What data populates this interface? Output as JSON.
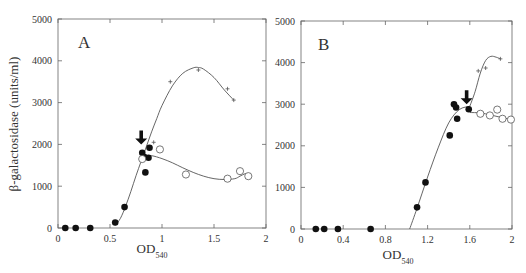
{
  "figure": {
    "ylabel": "β-galactosidase (units/ml)",
    "xlabel_main": "OD",
    "xlabel_sub": "540"
  },
  "chart_data": [
    {
      "type": "scatter",
      "panel": "A",
      "xlabel": "OD540",
      "ylabel": "β-galactosidase (units/ml)",
      "xlim": [
        0,
        2
      ],
      "ylim": [
        0,
        5000
      ],
      "xticks": [
        0,
        0.5,
        1,
        1.5,
        2
      ],
      "xtick_labels": [
        "0",
        "0.5",
        "1",
        "1.5",
        "2"
      ],
      "yticks": [
        0,
        1000,
        2000,
        3000,
        4000,
        5000
      ],
      "ytick_labels": [
        "0",
        "1000",
        "2000",
        "3000",
        "4000",
        "5000"
      ],
      "grid": false,
      "annotations": [
        {
          "type": "arrow-down",
          "x": 0.8,
          "y": 2000
        }
      ],
      "series": [
        {
          "name": "filled-circles",
          "marker": "filled-circle",
          "x": [
            0.07,
            0.17,
            0.31,
            0.55,
            0.64,
            0.81,
            0.83,
            0.84,
            0.87,
            0.88
          ],
          "y": [
            0,
            0,
            0,
            130,
            500,
            1800,
            1700,
            1330,
            1680,
            1920
          ]
        },
        {
          "name": "open-circles",
          "marker": "open-circle",
          "x": [
            0.81,
            0.98,
            1.23,
            1.63,
            1.75,
            1.83
          ],
          "y": [
            1650,
            1880,
            1280,
            1180,
            1360,
            1240
          ]
        },
        {
          "name": "plus-markers",
          "marker": "plus",
          "x": [
            0.92,
            1.08,
            1.35,
            1.63,
            1.69
          ],
          "y": [
            2050,
            3500,
            3780,
            3330,
            3060
          ]
        }
      ],
      "curves": [
        {
          "name": "rise-and-peak-curve",
          "x": [
            0.55,
            0.6,
            0.65,
            0.7,
            0.75,
            0.8,
            0.85,
            0.9,
            0.95,
            1.0,
            1.1,
            1.2,
            1.3,
            1.35,
            1.4,
            1.5,
            1.6,
            1.69
          ],
          "y": [
            60,
            230,
            520,
            870,
            1250,
            1600,
            1950,
            2300,
            2620,
            2930,
            3400,
            3700,
            3830,
            3840,
            3800,
            3600,
            3300,
            3060
          ]
        },
        {
          "name": "plateau-curve",
          "x": [
            0.83,
            0.9,
            1.0,
            1.1,
            1.2,
            1.3,
            1.4,
            1.5,
            1.6,
            1.7,
            1.75,
            1.8,
            1.83
          ],
          "y": [
            1720,
            1730,
            1660,
            1560,
            1440,
            1330,
            1240,
            1180,
            1160,
            1180,
            1240,
            1300,
            1300
          ]
        }
      ]
    },
    {
      "type": "scatter",
      "panel": "B",
      "xlabel": "OD540",
      "ylabel": "β-galactosidase (units/ml)",
      "xlim": [
        0,
        2
      ],
      "ylim": [
        0,
        5000
      ],
      "xticks": [
        0,
        0.4,
        0.8,
        1.2,
        1.6,
        2
      ],
      "xtick_labels": [
        "0",
        "0.4",
        "0.8",
        "1.2",
        "1.6",
        "2"
      ],
      "yticks": [
        0,
        1000,
        2000,
        3000,
        4000,
        5000
      ],
      "ytick_labels": [
        "0",
        "1000",
        "2000",
        "3000",
        "4000",
        "5000"
      ],
      "grid": false,
      "annotations": [
        {
          "type": "arrow-down",
          "x": 1.57,
          "y": 3000
        }
      ],
      "series": [
        {
          "name": "filled-circles",
          "marker": "filled-circle",
          "x": [
            0.14,
            0.22,
            0.35,
            0.66,
            1.1,
            1.18,
            1.41,
            1.45,
            1.47,
            1.48,
            1.59
          ],
          "y": [
            0,
            0,
            0,
            0,
            520,
            1120,
            2250,
            3000,
            2920,
            2650,
            2880
          ]
        },
        {
          "name": "open-circles",
          "marker": "open-circle",
          "x": [
            1.7,
            1.79,
            1.86,
            1.91,
            1.99
          ],
          "y": [
            2770,
            2730,
            2870,
            2650,
            2630
          ]
        },
        {
          "name": "plus-markers",
          "marker": "plus",
          "x": [
            1.68,
            1.75,
            1.89
          ],
          "y": [
            3800,
            3870,
            4090
          ]
        }
      ],
      "curves": [
        {
          "name": "rise-curve",
          "x": [
            1.03,
            1.1,
            1.2,
            1.3,
            1.4,
            1.5,
            1.6
          ],
          "y": [
            0,
            500,
            1250,
            1950,
            2550,
            2870,
            2950
          ]
        },
        {
          "name": "induction-curve",
          "x": [
            1.6,
            1.65,
            1.7,
            1.75,
            1.8,
            1.85,
            1.89
          ],
          "y": [
            2950,
            3300,
            3750,
            4050,
            4150,
            4130,
            4090
          ]
        },
        {
          "name": "plateau-curve",
          "x": [
            1.6,
            1.7,
            1.8,
            1.9,
            2.0
          ],
          "y": [
            2800,
            2790,
            2740,
            2680,
            2630
          ]
        }
      ]
    }
  ]
}
